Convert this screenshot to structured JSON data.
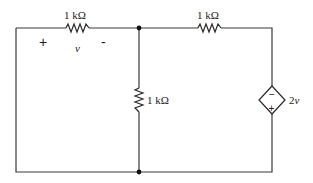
{
  "diagram": {
    "type": "circuit-schematic",
    "components": {
      "r_top_left": {
        "label": "1 kΩ"
      },
      "r_top_right": {
        "label": "1 kΩ"
      },
      "r_middle": {
        "label": "1 kΩ"
      },
      "dependent_source": {
        "label": "2v",
        "type": "dependent-voltage-source",
        "top_sign": "−",
        "bottom_sign": "+"
      }
    },
    "voltage_marker": {
      "plus": "+",
      "name": "v",
      "minus": "-"
    }
  }
}
